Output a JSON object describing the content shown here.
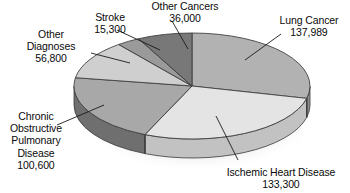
{
  "chart_data": {
    "type": "pie",
    "title": "",
    "subtitle": "",
    "xlabel": "",
    "ylabel": "",
    "legend_position": "callout-labels",
    "grid": false,
    "total": 479989,
    "categories": [
      "Lung Cancer",
      "Ischemic Heart Disease",
      "Chronic Obstructive Pulmonary Disease",
      "Other Diagnoses",
      "Stroke",
      "Other Cancers"
    ],
    "values": [
      137989,
      133300,
      100600,
      56800,
      15300,
      36000
    ],
    "value_labels": [
      "137,989",
      "133,300",
      "100,600",
      "56,800",
      "15,300",
      "36,000"
    ],
    "percentages": [
      28.7,
      27.8,
      21.0,
      11.8,
      3.2,
      7.5
    ],
    "slices": [
      {
        "name": "Lung Cancer",
        "label_lines": [
          "Lung Cancer"
        ],
        "value": 137989,
        "value_label": "137,989",
        "percent": 28.7,
        "color": "#b2b2b2",
        "side_color": "#8f8f8f",
        "start_angle": 0,
        "end_angle": 103.5
      },
      {
        "name": "Ischemic Heart Disease",
        "label_lines": [
          "Ischemic Heart Disease"
        ],
        "value": 133300,
        "value_label": "133,300",
        "percent": 27.8,
        "color": "#e4e4e4",
        "side_color": "#c2c2c2",
        "start_angle": 103.5,
        "end_angle": 203.5
      },
      {
        "name": "Chronic Obstructive Pulmonary Disease",
        "label_lines": [
          "Chronic",
          "Obstructive",
          "Pulmonary",
          "Disease"
        ],
        "value": 100600,
        "value_label": "100,600",
        "percent": 21.0,
        "color": "#a8a8a8",
        "side_color": "#6f6f6f",
        "start_angle": 203.5,
        "end_angle": 279.0
      },
      {
        "name": "Other Diagnoses",
        "label_lines": [
          "Other",
          "Diagnoses"
        ],
        "value": 56800,
        "value_label": "56,800",
        "percent": 11.8,
        "color": "#cfcfcf",
        "side_color": "#a5a5a5",
        "start_angle": 279.0,
        "end_angle": 321.6
      },
      {
        "name": "Stroke",
        "label_lines": [
          "Stroke"
        ],
        "value": 15300,
        "value_label": "15,300",
        "percent": 3.2,
        "color": "#9a9a9a",
        "side_color": "#7b7b7b",
        "start_angle": 321.6,
        "end_angle": 333.1
      },
      {
        "name": "Other Cancers",
        "label_lines": [
          "Other Cancers"
        ],
        "value": 36000,
        "value_label": "36,000",
        "percent": 7.5,
        "color": "#787878",
        "side_color": "#5d5d5d",
        "start_angle": 333.1,
        "end_angle": 360
      }
    ]
  },
  "labels": {
    "other_cancers": {
      "line1": "Other Cancers",
      "value": "36,000"
    },
    "stroke": {
      "line1": "Stroke",
      "value": "15,300"
    },
    "other_diagnoses": {
      "line1": "Other",
      "line2": "Diagnoses",
      "value": "56,800"
    },
    "lung_cancer": {
      "line1": "Lung Cancer",
      "value": "137,989"
    },
    "copd": {
      "line1": "Chronic",
      "line2": "Obstructive",
      "line3": "Pulmonary",
      "line4": "Disease",
      "value": "100,600"
    },
    "ischemic": {
      "line1": "Ischemic Heart Disease",
      "value": "133,300"
    }
  },
  "colors": {
    "text": "#0a0a0a",
    "background": "#ffffff",
    "outline": "#3a3a3a",
    "leader_line": "#1a1a1a",
    "shadow": "#d8d8d8"
  }
}
